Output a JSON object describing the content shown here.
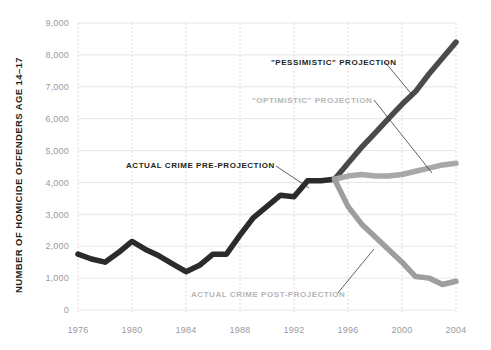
{
  "chart_data": {
    "type": "line",
    "title": "",
    "xlabel": "",
    "ylabel": "NUMBER OF HOMICIDE OFFENDERS AGE 14–17",
    "xlim": [
      1976,
      2004
    ],
    "ylim": [
      0,
      9000
    ],
    "grid": "horizontal solid light gray, vertical dotted light gray",
    "legend_position": "inline annotations",
    "x_ticks": [
      "1976",
      "1980",
      "1984",
      "1988",
      "1992",
      "1996",
      "2000",
      "2004"
    ],
    "x_tick_values": [
      1976,
      1980,
      1984,
      1988,
      1992,
      1996,
      2000,
      2004
    ],
    "y_ticks": [
      "0",
      "1,000",
      "2,000",
      "3,000",
      "4,000",
      "5,000",
      "6,000",
      "7,000",
      "8,000",
      "9,000"
    ],
    "y_tick_values": [
      0,
      1000,
      2000,
      3000,
      4000,
      5000,
      6000,
      7000,
      8000,
      9000
    ],
    "series": [
      {
        "name": "ACTUAL CRIME PRE-PROJECTION",
        "color": "#2b2b2b",
        "x": [
          1976,
          1977,
          1978,
          1979,
          1980,
          1981,
          1982,
          1983,
          1984,
          1985,
          1986,
          1987,
          1988,
          1989,
          1990,
          1991,
          1992,
          1993,
          1994,
          1995
        ],
        "values": [
          1750,
          1600,
          1500,
          1800,
          2150,
          1900,
          1700,
          1450,
          1200,
          1400,
          1750,
          1750,
          2350,
          2900,
          3250,
          3600,
          3550,
          4050,
          4050,
          4100
        ]
      },
      {
        "name": "\"PESSIMISTIC\" PROJECTION",
        "color": "#4a4a4a",
        "x": [
          1995,
          1996,
          1997,
          1998,
          1999,
          2000,
          2001,
          2002,
          2003,
          2004
        ],
        "values": [
          4100,
          4600,
          5100,
          5550,
          6000,
          6450,
          6850,
          7400,
          7900,
          8400
        ]
      },
      {
        "name": "\"OPTIMISTIC\" PROJECTION",
        "color": "#a8a8a8",
        "x": [
          1995,
          1996,
          1997,
          1998,
          1999,
          2000,
          2001,
          2002,
          2003,
          2004
        ],
        "values": [
          4100,
          4200,
          4250,
          4200,
          4200,
          4250,
          4350,
          4450,
          4550,
          4600
        ]
      },
      {
        "name": "ACTUAL CRIME POST-PROJECTION",
        "color": "#9e9e9e",
        "x": [
          1995,
          1996,
          1997,
          1998,
          1999,
          2000,
          2001,
          2002,
          2003,
          2004
        ],
        "values": [
          4100,
          3250,
          2700,
          2300,
          1900,
          1500,
          1050,
          1000,
          800,
          900
        ]
      }
    ],
    "annotations": [
      {
        "id": "pre-projection",
        "text": "ACTUAL CRIME PRE-PROJECTION",
        "style": "dark"
      },
      {
        "id": "pessimistic",
        "text": "\"PESSIMISTIC\" PROJECTION",
        "style": "dark"
      },
      {
        "id": "optimistic",
        "text": "\"OPTIMISTIC\" PROJECTION",
        "style": "gray"
      },
      {
        "id": "post-projection",
        "text": "ACTUAL CRIME POST-PROJECTION",
        "style": "gray"
      }
    ],
    "colors": {
      "dark_line": "#2b2b2b",
      "pessimistic_line": "#4a4a4a",
      "optimistic_line": "#a8a8a8",
      "post_projection_line": "#9e9e9e",
      "gridline": "#e6e6e6",
      "dotted_gridline": "#d2d2d2",
      "tick_label": "#9a9a9a",
      "axis_title": "#231f20",
      "background": "#ffffff"
    }
  }
}
